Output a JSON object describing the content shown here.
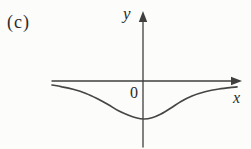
{
  "figure": {
    "panel_label": "(c)",
    "x_axis_label": "x",
    "y_axis_label": "y",
    "origin_label": "0"
  },
  "colors": {
    "background": "#fcfcfa",
    "axis_stroke": "#3f3f3f",
    "curve_stroke": "#454545",
    "text": "#2b2b2b"
  },
  "chart_data": {
    "type": "line",
    "x_range_px": [
      52,
      237
    ],
    "axes": {
      "x_axis": {
        "from": [
          52,
          81
        ],
        "tip": [
          242,
          81
        ]
      },
      "y_axis": {
        "from": [
          143,
          147
        ],
        "tip": [
          143,
          11
        ]
      }
    },
    "curve_points_px": [
      [
        52,
        85
      ],
      [
        62,
        86.8
      ],
      [
        74,
        89.5
      ],
      [
        86,
        93.5
      ],
      [
        97,
        98.5
      ],
      [
        108,
        104.5
      ],
      [
        118,
        110.5
      ],
      [
        128,
        115
      ],
      [
        136,
        117.8
      ],
      [
        144,
        119
      ],
      [
        152,
        117.8
      ],
      [
        161,
        114
      ],
      [
        171,
        108
      ],
      [
        181,
        101.5
      ],
      [
        192,
        96
      ],
      [
        205,
        91.8
      ],
      [
        219,
        89
      ],
      [
        237,
        86.8
      ]
    ]
  }
}
